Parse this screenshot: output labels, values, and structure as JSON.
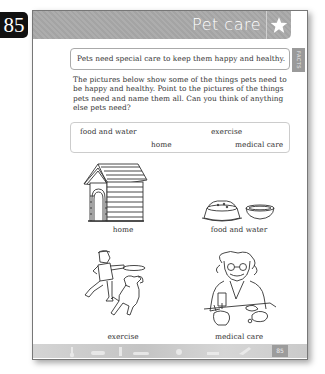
{
  "page_badge": "85",
  "header": {
    "title": "Pet care",
    "star_icon": "star-icon"
  },
  "facts_tab": "FACTS",
  "fact": "Pets need special care to keep them happy and healthy.",
  "instructions": "The pictures below show some of the things pets need to be happy and healthy. Point to the pictures of the things pets need and name them all. Can you think of anything else pets need?",
  "word_box": {
    "words": [
      "food and water",
      "exercise",
      "home",
      "medical care"
    ]
  },
  "pictures": [
    {
      "caption": "home",
      "icon": "doghouse-icon"
    },
    {
      "caption": "food and water",
      "icon": "pet-bowls-icon"
    },
    {
      "caption": "exercise",
      "icon": "boy-frisbee-dog-icon"
    },
    {
      "caption": "medical care",
      "icon": "vet-icon"
    }
  ],
  "footer": {
    "page_number": "85"
  },
  "colors": {
    "header_bg": "#a9a9a9",
    "badge_bg": "#111111",
    "footer_bg": "#cfcfcf"
  }
}
